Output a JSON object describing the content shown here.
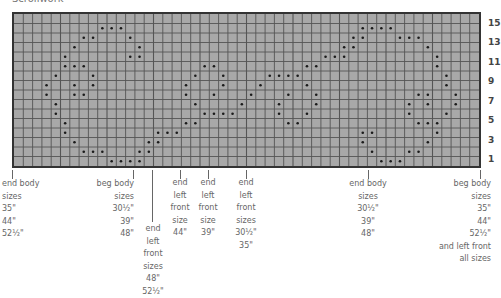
{
  "title": "Scrollwork",
  "grid": {
    "columns": 50,
    "rows": 16,
    "colors": {
      "fill": "#a8a8a8",
      "line": "#555555",
      "border": "#333333",
      "dot": "#1a1a1a"
    },
    "dots_by_row_from_top": [
      [],
      [
        9,
        10,
        11,
        37,
        38,
        39,
        40
      ],
      [
        7,
        8,
        12,
        36,
        37,
        41,
        42,
        43
      ],
      [
        6,
        13,
        35,
        36,
        44
      ],
      [
        5,
        12,
        13,
        33,
        34,
        35,
        45
      ],
      [
        5,
        6,
        7,
        20,
        21,
        31,
        32,
        45
      ],
      [
        4,
        8,
        19,
        22,
        27,
        28,
        29,
        30,
        46
      ],
      [
        3,
        6,
        8,
        18,
        22,
        26,
        31,
        46
      ],
      [
        3,
        6,
        7,
        18,
        21,
        25,
        29,
        32,
        43,
        44,
        47
      ],
      [
        4,
        19,
        24,
        28,
        32,
        42,
        44,
        47
      ],
      [
        4,
        20,
        21,
        22,
        23,
        28,
        31,
        42,
        46
      ],
      [
        5,
        18,
        19,
        29,
        30,
        43,
        44,
        45
      ],
      [
        5,
        15,
        16,
        17,
        37,
        38,
        45
      ],
      [
        6,
        14,
        15,
        37,
        44
      ],
      [
        7,
        8,
        9,
        13,
        14,
        38,
        42,
        43
      ],
      [
        10,
        11,
        12,
        13,
        39,
        40,
        41
      ]
    ]
  },
  "row_labels": [
    "15",
    "13",
    "11",
    "9",
    "7",
    "5",
    "3",
    "1"
  ],
  "markers": [
    {
      "name": "end-body-sizes-35-44-52half",
      "lines": [
        "end body",
        "sizes",
        "35\"",
        "44\"",
        "52½\""
      ]
    },
    {
      "name": "beg-body-sizes-30half-39-48",
      "lines": [
        "beg body",
        "sizes",
        "30½\"",
        "39\"",
        "48\""
      ]
    },
    {
      "name": "end-left-front-sizes-48-52half",
      "lines": [
        "end",
        "left",
        "front",
        "sizes",
        "48\"",
        "52½\""
      ]
    },
    {
      "name": "end-left-front-size-44",
      "lines": [
        "end",
        "left",
        "front",
        "size",
        "44\""
      ]
    },
    {
      "name": "end-left-front-size-39",
      "lines": [
        "end",
        "left",
        "front",
        "size",
        "39\""
      ]
    },
    {
      "name": "end-left-front-sizes-30half-35",
      "lines": [
        "end",
        "left",
        "front",
        "sizes",
        "30½\"",
        "35\""
      ]
    },
    {
      "name": "end-body-sizes-30half-39-48",
      "lines": [
        "end body",
        "sizes",
        "30½\"",
        "39\"",
        "48\""
      ]
    },
    {
      "name": "beg-body-sizes-35-44-52half-left-front",
      "lines": [
        "beg body",
        "sizes",
        "35\"",
        "44\"",
        "52½\"",
        "and left front",
        "all sizes"
      ]
    }
  ]
}
